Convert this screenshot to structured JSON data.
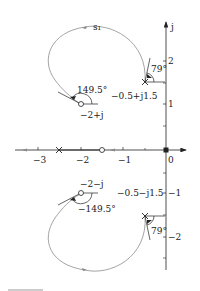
{
  "diagram": {
    "type": "root-locus",
    "axes": {
      "real_axis_ticks": [
        {
          "value": -3,
          "label": "−3"
        },
        {
          "value": -2,
          "label": "−2"
        },
        {
          "value": -1,
          "label": "−1"
        },
        {
          "value": 0,
          "label": "0"
        }
      ],
      "imag_axis_ticks": [
        {
          "value": 2,
          "label": "2"
        },
        {
          "value": 1,
          "label": "1"
        },
        {
          "value": -1,
          "label": "−1"
        },
        {
          "value": -2,
          "label": "−2"
        }
      ],
      "imag_axis_label": "j"
    },
    "curve_label": "s₁",
    "poles": [
      {
        "label": "−0.5+j1.5",
        "re": -0.5,
        "im": 1.5
      },
      {
        "label": "−0.5−j1.5",
        "re": -0.5,
        "im": -1.5
      },
      {
        "label": "",
        "re": -2.5,
        "im": 0
      },
      {
        "label": "",
        "re": 0,
        "im": 0
      }
    ],
    "zeros": [
      {
        "label": "−2+j",
        "re": -2,
        "im": 1
      },
      {
        "label": "−2−j",
        "re": -2,
        "im": -1
      },
      {
        "label": "",
        "re": -1.5,
        "im": 0
      }
    ],
    "angles": {
      "departure_upper": "79°",
      "departure_lower": "79°",
      "arrival_upper": "149.5°",
      "arrival_lower": "−149.5°"
    },
    "colors": {
      "axis": "#222222",
      "locus": "#9a9a9a",
      "marker": "#222222"
    }
  }
}
